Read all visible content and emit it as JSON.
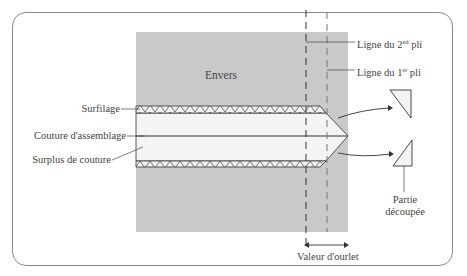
{
  "diagram": {
    "labels": {
      "envers": "Envers",
      "surfilage": "Surfilage",
      "couture": "Couture d'assemblage",
      "surplus": "Surplus de couture",
      "ligne2_prefix": "Ligne du 2",
      "ligne2_sup": "nd",
      "ligne2_suffix": " pli",
      "ligne1_prefix": "Ligne du 1",
      "ligne1_sup": "er",
      "ligne1_suffix": " pli",
      "partie_line1": "Partie",
      "partie_line2": "découpée",
      "valeur": "Valeur d'ourlet"
    },
    "colors": {
      "fabric": "#c9c9c9",
      "allowance": "#f4f4f4",
      "line": "#333333",
      "frame": "#8a8a8a"
    }
  }
}
